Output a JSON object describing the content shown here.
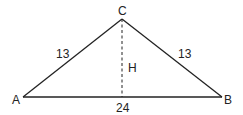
{
  "diagram": {
    "type": "isosceles-triangle",
    "vertices": {
      "A": {
        "label": "A",
        "x": 23,
        "y": 97
      },
      "B": {
        "label": "B",
        "x": 222,
        "y": 97
      },
      "C": {
        "label": "C",
        "x": 122,
        "y": 19
      }
    },
    "sides": {
      "AC": {
        "label": "13"
      },
      "BC": {
        "label": "13"
      },
      "AB": {
        "label": "24"
      }
    },
    "height": {
      "label": "H",
      "style": "dashed"
    },
    "colors": {
      "stroke": "#222222",
      "background": "#ffffff"
    }
  }
}
